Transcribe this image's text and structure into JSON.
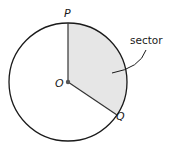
{
  "diagram": {
    "type": "circle-sector",
    "colors": {
      "stroke": "#1a1a1a",
      "sector_fill": "#e6e6e6",
      "center_dot": "#555555",
      "background": "#ffffff"
    },
    "circle": {
      "cx": 68,
      "cy": 82,
      "r": 59
    },
    "points": {
      "P": {
        "label": "P",
        "x": 68,
        "y": 23
      },
      "O": {
        "label": "O",
        "x": 68,
        "y": 82
      },
      "Q": {
        "label": "Q",
        "x": 117,
        "y": 115
      }
    },
    "labels": {
      "P": "P",
      "O": "O",
      "Q": "Q",
      "sector": "sector"
    }
  }
}
